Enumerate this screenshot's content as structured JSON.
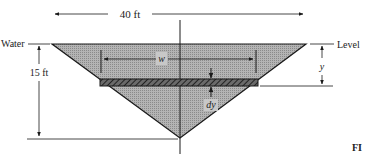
{
  "diagram": {
    "labels": {
      "top_width": "40 ft",
      "height": "15 ft",
      "water": "Water",
      "level": "Level",
      "strip_width": "w",
      "depth": "y",
      "thickness": "dy",
      "figure_fragment": "FI"
    },
    "colors": {
      "fill": "#a8a8a8",
      "stroke": "#1a1a1a",
      "strip": "#555555",
      "background": "#ffffff"
    }
  }
}
